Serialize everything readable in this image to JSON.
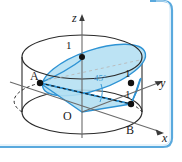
{
  "figure": {
    "axes": {
      "z_label": "z",
      "y_label": "y",
      "x_label": "x",
      "origin_label": "O"
    },
    "points": [
      {
        "name": "point-A",
        "label": "A"
      },
      {
        "name": "point-B",
        "label": "B"
      }
    ],
    "tick_labels": [
      {
        "name": "tick-z-one",
        "label": "1"
      },
      {
        "name": "tick-y-one",
        "label": "1"
      },
      {
        "name": "tick-x-one",
        "label": "1"
      }
    ],
    "angle_label": "45°",
    "colors": {
      "plane_fill": "#b3dff2",
      "plane_stroke": "#2e93d4",
      "angle_text": "#3b9ad6",
      "outline": "#2b2b2b",
      "border": "#5aa9dd"
    }
  }
}
